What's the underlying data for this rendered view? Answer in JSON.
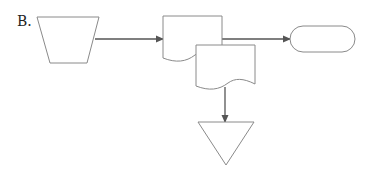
{
  "diagram": {
    "label": "B.",
    "type": "flowchart",
    "stroke_color": "#8a8a8a",
    "arrow_color": "#555555",
    "nodes": [
      {
        "id": "manual-operation",
        "shape": "trapezoid",
        "text": ""
      },
      {
        "id": "document-1",
        "shape": "document",
        "text": ""
      },
      {
        "id": "document-2",
        "shape": "document",
        "text": ""
      },
      {
        "id": "terminator",
        "shape": "rounded-rectangle",
        "text": ""
      },
      {
        "id": "offline-storage",
        "shape": "inverted-triangle",
        "text": ""
      }
    ],
    "edges": [
      {
        "from": "manual-operation",
        "to": "document-1"
      },
      {
        "from": "document-1",
        "to": "terminator"
      },
      {
        "from": "document-2",
        "to": "offline-storage"
      }
    ]
  }
}
